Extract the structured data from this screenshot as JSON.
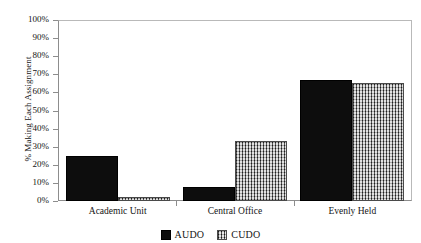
{
  "chart_data": {
    "type": "bar",
    "title": "",
    "xlabel": "",
    "ylabel": "% Making Each Assignment",
    "ylim": [
      0,
      100
    ],
    "grid": false,
    "legend_position": "bottom-center",
    "categories": [
      "Academic Unit",
      "Central Office",
      "Evenly Held"
    ],
    "ytick_labels": [
      "0%",
      "10%",
      "20%",
      "30%",
      "40%",
      "50%",
      "60%",
      "70%",
      "80%",
      "90%",
      "100%"
    ],
    "ytick_values": [
      0,
      10,
      20,
      30,
      40,
      50,
      60,
      70,
      80,
      90,
      100
    ],
    "series": [
      {
        "name": "AUDO",
        "color": "#0d0d0d",
        "fill": "solid-black",
        "values": [
          25,
          8,
          67
        ]
      },
      {
        "name": "CUDO",
        "color": "#8a8a8a",
        "fill": "gray-crosshatch",
        "values": [
          2,
          33,
          65
        ]
      }
    ]
  }
}
